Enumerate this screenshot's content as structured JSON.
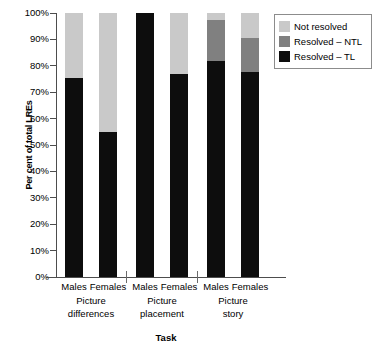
{
  "chart_data": {
    "type": "bar",
    "subtype": "stacked-bar-100-percent",
    "title": "",
    "xlabel": "Task",
    "ylabel": "Per cent of total LREs",
    "ylim": [
      0,
      100
    ],
    "ytick_labels": [
      "100%",
      "90%",
      "80%",
      "70%",
      "60%",
      "50%",
      "40%",
      "30%",
      "20%",
      "10%",
      "0%"
    ],
    "ytick_values": [
      100,
      90,
      80,
      70,
      60,
      50,
      40,
      30,
      20,
      10,
      0
    ],
    "grid": false,
    "legend_position": "top-right",
    "categories": [
      "Males",
      "Females",
      "Males",
      "Females",
      "Males",
      "Females"
    ],
    "groups": [
      {
        "label_line1": "Picture",
        "label_line2": "differences",
        "categories": [
          "Males",
          "Females"
        ]
      },
      {
        "label_line1": "Picture",
        "label_line2": "placement",
        "categories": [
          "Males",
          "Females"
        ]
      },
      {
        "label_line1": "Picture",
        "label_line2": "story",
        "categories": [
          "Males",
          "Females"
        ]
      }
    ],
    "series": [
      {
        "name": "Resolved – TL",
        "color": "#0d0d0d",
        "values": [
          75.2,
          55.0,
          100.0,
          77.0,
          82.0,
          77.5
        ]
      },
      {
        "name": "Resolved – NTL",
        "color": "#808080",
        "values": [
          0.0,
          0.0,
          0.0,
          0.0,
          15.5,
          13.0
        ]
      },
      {
        "name": "Not resolved",
        "color": "#c9c9c9",
        "values": [
          24.8,
          45.0,
          0.0,
          23.0,
          2.5,
          9.5
        ]
      }
    ],
    "legend": [
      {
        "label": "Not resolved",
        "color": "#c9c9c9"
      },
      {
        "label": "Resolved – NTL",
        "color": "#808080"
      },
      {
        "label": "Resolved – TL",
        "color": "#0d0d0d"
      }
    ]
  }
}
